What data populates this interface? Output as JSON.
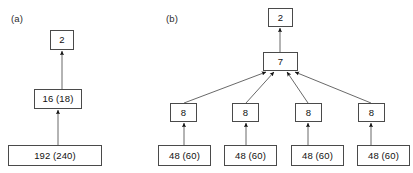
{
  "figure": {
    "background_color": "#ffffff",
    "box_border_color": "#4a4a4a",
    "edge_color": "#585858",
    "arrow_fill_color": "#101010",
    "panels": [
      {
        "id": "a",
        "label": "(a)",
        "nodes": [
          {
            "id": "a-top",
            "text": "2",
            "x": 50,
            "y": 30,
            "w": 24,
            "h": 20
          },
          {
            "id": "a-middle",
            "text": "16 (18)",
            "x": 34,
            "y": 89,
            "w": 48,
            "h": 20
          },
          {
            "id": "a-bottom",
            "text": "192 (240)",
            "x": 8,
            "y": 145,
            "w": 94,
            "h": 21
          }
        ],
        "edges": [
          {
            "from": "a-bottom",
            "to": "a-middle",
            "x1": 58,
            "y1": 145,
            "x2": 58,
            "y2": 109
          },
          {
            "from": "a-middle",
            "to": "a-top",
            "x1": 62,
            "y1": 89,
            "x2": 62,
            "y2": 50
          }
        ]
      },
      {
        "id": "b",
        "label": "(b)",
        "nodes": [
          {
            "id": "b-top",
            "text": "2",
            "x": 268,
            "y": 8,
            "w": 25,
            "h": 19
          },
          {
            "id": "b-mid",
            "text": "7",
            "x": 263,
            "y": 52,
            "w": 35,
            "h": 19
          },
          {
            "id": "b-l1",
            "text": "8",
            "x": 170,
            "y": 103,
            "w": 27,
            "h": 19
          },
          {
            "id": "b-l2",
            "text": "8",
            "x": 232,
            "y": 103,
            "w": 27,
            "h": 19
          },
          {
            "id": "b-l3",
            "text": "8",
            "x": 295,
            "y": 103,
            "w": 27,
            "h": 19
          },
          {
            "id": "b-l4",
            "text": "8",
            "x": 358,
            "y": 103,
            "w": 27,
            "h": 19
          },
          {
            "id": "b-b1",
            "text": "48 (60)",
            "x": 158,
            "y": 145,
            "w": 53,
            "h": 21
          },
          {
            "id": "b-b2",
            "text": "48 (60)",
            "x": 224,
            "y": 145,
            "w": 53,
            "h": 21
          },
          {
            "id": "b-b3",
            "text": "48 (60)",
            "x": 291,
            "y": 145,
            "w": 53,
            "h": 21
          },
          {
            "id": "b-b4",
            "text": "48 (60)",
            "x": 357,
            "y": 145,
            "w": 53,
            "h": 21
          }
        ],
        "edges": [
          {
            "from": "b-mid",
            "to": "b-top",
            "x1": 280,
            "y1": 52,
            "x2": 280,
            "y2": 27
          },
          {
            "from": "b-l1",
            "to": "b-mid",
            "x1": 184,
            "y1": 103,
            "x2": 267,
            "y2": 71
          },
          {
            "from": "b-l2",
            "to": "b-mid",
            "x1": 246,
            "y1": 103,
            "x2": 274,
            "y2": 71
          },
          {
            "from": "b-l3",
            "to": "b-mid",
            "x1": 308,
            "y1": 103,
            "x2": 287,
            "y2": 71
          },
          {
            "from": "b-l4",
            "to": "b-mid",
            "x1": 371,
            "y1": 103,
            "x2": 294,
            "y2": 71
          },
          {
            "from": "b-b1",
            "to": "b-l1",
            "x1": 184,
            "y1": 145,
            "x2": 184,
            "y2": 122
          },
          {
            "from": "b-b2",
            "to": "b-l2",
            "x1": 246,
            "y1": 145,
            "x2": 246,
            "y2": 122
          },
          {
            "from": "b-b3",
            "to": "b-l3",
            "x1": 308,
            "y1": 145,
            "x2": 308,
            "y2": 122
          },
          {
            "from": "b-b4",
            "to": "b-l4",
            "x1": 371,
            "y1": 145,
            "x2": 371,
            "y2": 122
          }
        ]
      }
    ]
  }
}
